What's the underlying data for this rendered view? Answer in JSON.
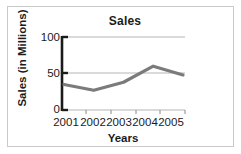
{
  "chart_data": {
    "type": "line",
    "title": "Sales",
    "xlabel": "Years",
    "ylabel": "Sales (in Millions)",
    "categories": [
      "2001",
      "2002",
      "2003",
      "2004",
      "2005"
    ],
    "values": [
      35,
      27,
      38,
      60,
      48
    ],
    "ylim": [
      0,
      100
    ],
    "yticks": [
      0,
      50,
      100
    ],
    "ytick_labels": [
      "0",
      "50",
      "100"
    ],
    "grid": "horizontal",
    "legend": "none",
    "series_color": "#7b7b7b",
    "axis_color": "#1b1b1b",
    "grid_color": "#b5b5b5",
    "frame_color": "#c9c9c9",
    "background": "#ffffff"
  }
}
